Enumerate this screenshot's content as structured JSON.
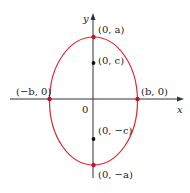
{
  "diagram": {
    "type": "ellipse",
    "axes": {
      "x_label": "x",
      "y_label": "y",
      "origin_label": "0"
    },
    "points": {
      "top_vertex": "(0, a)",
      "bottom_vertex": "(0, −a)",
      "left_vertex": "(−b, 0)",
      "right_vertex": "(b, 0)",
      "upper_focus": "(0, c)",
      "lower_focus": "(0, −c)"
    },
    "colors": {
      "ellipse": "#d9272e",
      "vertex": "#c8102e",
      "focus": "#111111",
      "axis": "#333333"
    }
  }
}
